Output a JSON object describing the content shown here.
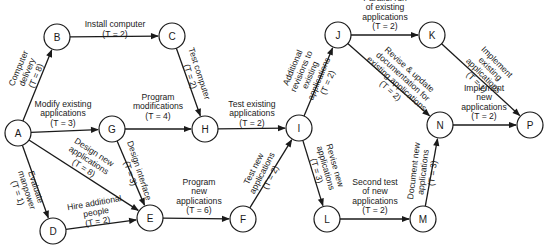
{
  "diagram": {
    "type": "activity-on-node network",
    "nodes": [
      {
        "id": "A",
        "label": "A",
        "x": 18,
        "y": 133
      },
      {
        "id": "B",
        "label": "B",
        "x": 57,
        "y": 37
      },
      {
        "id": "C",
        "label": "C",
        "x": 172,
        "y": 36
      },
      {
        "id": "D",
        "label": "D",
        "x": 53,
        "y": 231
      },
      {
        "id": "E",
        "label": "E",
        "x": 150,
        "y": 218
      },
      {
        "id": "F",
        "label": "F",
        "x": 243,
        "y": 219
      },
      {
        "id": "G",
        "label": "G",
        "x": 112,
        "y": 129
      },
      {
        "id": "H",
        "label": "H",
        "x": 205,
        "y": 129
      },
      {
        "id": "I",
        "label": "I",
        "x": 299,
        "y": 128
      },
      {
        "id": "J",
        "label": "J",
        "x": 338,
        "y": 35
      },
      {
        "id": "K",
        "label": "K",
        "x": 432,
        "y": 35
      },
      {
        "id": "L",
        "label": "L",
        "x": 327,
        "y": 219
      },
      {
        "id": "M",
        "label": "M",
        "x": 423,
        "y": 219
      },
      {
        "id": "N",
        "label": "N",
        "x": 440,
        "y": 125
      },
      {
        "id": "P",
        "label": "P",
        "x": 530,
        "y": 125
      }
    ],
    "edges": [
      {
        "from": "A",
        "to": "B",
        "lines": [
          "Computer",
          "delivery",
          "(T = 8)"
        ],
        "lx": 27,
        "ly": 72,
        "rot": -67
      },
      {
        "from": "B",
        "to": "C",
        "lines": [
          "Install computer",
          "(T = 2)"
        ],
        "lx": 115,
        "ly": 29,
        "rot": 0
      },
      {
        "from": "C",
        "to": "H",
        "lines": [
          "Test computer",
          "(T = 2)"
        ],
        "lx": 195,
        "ly": 75,
        "rot": 72
      },
      {
        "from": "A",
        "to": "G",
        "lines": [
          "Modify existing",
          "applications",
          "(T = 3)"
        ],
        "lx": 63,
        "ly": 113,
        "rot": 0
      },
      {
        "from": "G",
        "to": "H",
        "lines": [
          "Program",
          "modifications",
          "(T = 4)"
        ],
        "lx": 158,
        "ly": 106,
        "rot": 0
      },
      {
        "from": "H",
        "to": "I",
        "lines": [
          "Test existing",
          "applications",
          "(T = 2)"
        ],
        "lx": 252,
        "ly": 113,
        "rot": 0
      },
      {
        "from": "A",
        "to": "D",
        "lines": [
          "Evaluate",
          "manpower",
          "(T = 1)"
        ],
        "lx": 27,
        "ly": 190,
        "rot": 72
      },
      {
        "from": "A",
        "to": "E",
        "lines": [
          "Design new",
          "applications",
          "(T = 8)"
        ],
        "lx": 89,
        "ly": 160,
        "rot": 33
      },
      {
        "from": "G",
        "to": "E",
        "lines": [
          "Design interface",
          "(T = 3)"
        ],
        "lx": 135,
        "ly": 172,
        "rot": 72
      },
      {
        "from": "D",
        "to": "E",
        "lines": [
          "Hire additional",
          "people",
          "(T = 2)"
        ],
        "lx": 96,
        "ly": 212,
        "rot": -10
      },
      {
        "from": "E",
        "to": "F",
        "lines": [
          "Program",
          "new",
          "applications",
          "(T = 6)"
        ],
        "lx": 199,
        "ly": 196,
        "rot": 0
      },
      {
        "from": "F",
        "to": "I",
        "lines": [
          "Test new",
          "applications",
          "(T = 2)"
        ],
        "lx": 262,
        "ly": 173,
        "rot": -63
      },
      {
        "from": "I",
        "to": "J",
        "lines": [
          "Additional",
          "revisions to",
          "existing",
          "applications",
          "(T = 2)"
        ],
        "lx": 310,
        "ly": 75,
        "rot": -67
      },
      {
        "from": "I",
        "to": "L",
        "lines": [
          "Revise new",
          "applications",
          "(T = 3)"
        ],
        "lx": 326,
        "ly": 168,
        "rot": 74
      },
      {
        "from": "L",
        "to": "M",
        "lines": [
          "Second test",
          "of new",
          "applications",
          "(T = 2)"
        ],
        "lx": 375,
        "ly": 196,
        "rot": 0
      },
      {
        "from": "J",
        "to": "K",
        "lines": [
          "Parallel run",
          "of existing",
          "applications",
          "(T = 2)"
        ],
        "lx": 385,
        "ly": 12,
        "rot": 0
      },
      {
        "from": "J",
        "to": "N",
        "lines": [
          "Revise & update",
          "documentation for",
          "existing applications",
          "(T = 2)"
        ],
        "lx": 400,
        "ly": 80,
        "rot": 42
      },
      {
        "from": "K",
        "to": "P",
        "lines": [
          "Implement",
          "existing",
          "applications",
          "(T = 1)"
        ],
        "lx": 487,
        "ly": 72,
        "rot": 45
      },
      {
        "from": "M",
        "to": "N",
        "lines": [
          "Document new",
          "applications",
          "(T = 3)"
        ],
        "lx": 423,
        "ly": 172,
        "rot": -83
      },
      {
        "from": "N",
        "to": "P",
        "lines": [
          "Implement",
          "new",
          "applications",
          "(T = 2)"
        ],
        "lx": 484,
        "ly": 102,
        "rot": 0
      }
    ]
  }
}
